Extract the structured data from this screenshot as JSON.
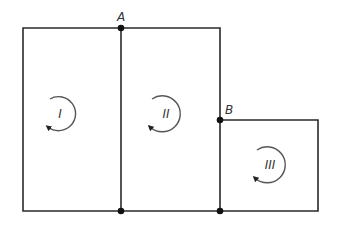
{
  "diagram": {
    "type": "circuit-loops",
    "colors": {
      "wire": "#2a2a2a",
      "loop": "#555555",
      "node": "#111111",
      "background": "#ffffff"
    },
    "nodes": [
      {
        "id": "A",
        "label": "A",
        "x": 121,
        "y": 28
      },
      {
        "id": "B",
        "label": "B",
        "x": 220,
        "y": 120
      },
      {
        "id": "bottom-middle",
        "label": "",
        "x": 121,
        "y": 211
      },
      {
        "id": "bottom-right",
        "label": "",
        "x": 220,
        "y": 211
      }
    ],
    "loops": [
      {
        "id": "I",
        "label": "I",
        "cx": 60,
        "cy": 113,
        "r": 17,
        "direction": "counterclockwise"
      },
      {
        "id": "II",
        "label": "II",
        "cx": 163,
        "cy": 113,
        "r": 18,
        "direction": "counterclockwise"
      },
      {
        "id": "III",
        "label": "III",
        "cx": 268,
        "cy": 164,
        "r": 18,
        "direction": "counterclockwise"
      }
    ]
  }
}
